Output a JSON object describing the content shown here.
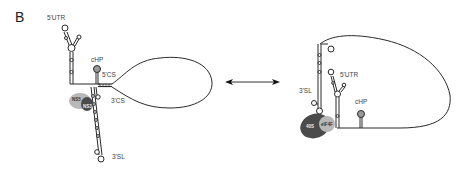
{
  "panel": {
    "label": "B"
  },
  "left_diagram": {
    "labels": {
      "utr5": "5'UTR",
      "chp": "cHP",
      "cs5": "5'CS",
      "cs3": "3'CS",
      "sl3": "3'SL",
      "ns5": "NS5",
      "ns3": "NS3"
    },
    "description": "Circularized (cyclized) genome conformation via 5'CS-3'CS complementarity"
  },
  "arrow": {
    "type": "bidirectional",
    "meaning": "equilibrium between conformations"
  },
  "right_diagram": {
    "labels": {
      "sl3": "3'SL",
      "utr5": "5'UTR",
      "chp": "cHP",
      "s40": "40S",
      "eif4f": "eIF4F"
    },
    "description": "Linear/translation-competent conformation with 40S and eIF4F bound"
  },
  "colors": {
    "line": "#2a2a2a",
    "protein_light": "#b8b8b8",
    "protein_dark": "#4a4a4a",
    "text": "#444444"
  }
}
